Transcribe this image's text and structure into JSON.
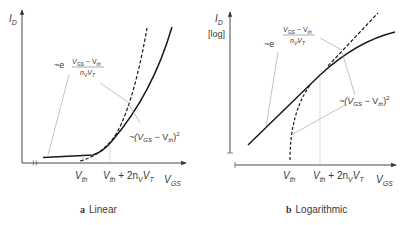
{
  "panels": [
    {
      "id": "a",
      "caption_letter": "a",
      "caption_text": "Linear",
      "y_axis": {
        "main": "I",
        "sub": "D",
        "scale": ""
      },
      "x_axis": {
        "main": "V",
        "sub": "GS"
      },
      "ticks": [
        {
          "main": "V",
          "sub": "th",
          "rest": ""
        },
        {
          "main": "V",
          "sub": "th",
          "rest": " + 2n",
          "rest_sub": "V",
          "rest2": "V",
          "rest2_sub": "T"
        }
      ],
      "annotations": {
        "exp": "~e",
        "fraction_num_main": "V",
        "fraction_num_sub": "GS",
        "fraction_num_minus": " − V",
        "fraction_num_sub2": "th",
        "fraction_den_main": "n",
        "fraction_den_sub": "V",
        "fraction_den_main2": "V",
        "fraction_den_sub2": "T",
        "square_prefix": "~(V",
        "square_sub": "GS",
        "square_mid": " − V",
        "square_sub2": "th",
        "square_suffix": ")",
        "square_exp": "2"
      }
    },
    {
      "id": "b",
      "caption_letter": "b",
      "caption_text": "Logarithmic",
      "y_axis": {
        "main": "I",
        "sub": "D",
        "scale": "[log]"
      },
      "x_axis": {
        "main": "V",
        "sub": "GS"
      },
      "ticks": [
        {
          "main": "V",
          "sub": "th",
          "rest": ""
        },
        {
          "main": "V",
          "sub": "th",
          "rest": " + 2n",
          "rest_sub": "V",
          "rest2": "V",
          "rest2_sub": "T"
        }
      ],
      "annotations": {
        "exp": "~e",
        "fraction_num_main": "V",
        "fraction_num_sub": "GS",
        "fraction_num_minus": " − V",
        "fraction_num_sub2": "th",
        "fraction_den_main": "n",
        "fraction_den_sub": "V",
        "fraction_den_main2": "V",
        "fraction_den_sub2": "T",
        "square_prefix": "~(V",
        "square_sub": "GS",
        "square_mid": " − V",
        "square_sub2": "th",
        "square_suffix": ")",
        "square_exp": "2"
      }
    }
  ],
  "colors": {
    "curve": "#1a1a1a",
    "axis": "#333333",
    "leader": "#9a9a9a",
    "guide": "#aaaaaa",
    "text": "#3a3a3a"
  }
}
